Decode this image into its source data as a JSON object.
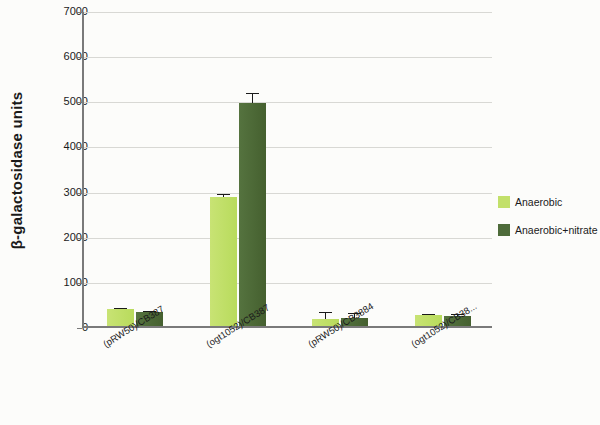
{
  "chart_data": {
    "type": "bar",
    "title": "",
    "xlabel": "",
    "ylabel": "β-galactosidase units",
    "ylim": [
      0,
      7000
    ],
    "ytick_step": 1000,
    "yticks": [
      "0",
      "1000",
      "2000",
      "3000",
      "4000",
      "5000",
      "6000",
      "7000"
    ],
    "grid": true,
    "legend_position": "right",
    "categories": [
      "(pRW50)/CB387",
      "(ogt1052)/CB387",
      "(pRW50)/CB3884",
      "(ogt1052)/CB38..."
    ],
    "series": [
      {
        "name": "Anaerobic",
        "color": "#c2e06a",
        "values": [
          370,
          2860,
          160,
          240
        ],
        "errors": [
          40,
          70,
          160,
          30
        ]
      },
      {
        "name": "Anaerobic+nitrate",
        "color": "#4e6b3a",
        "values": [
          300,
          4940,
          180,
          225
        ],
        "errors": [
          30,
          220,
          110,
          35
        ]
      }
    ]
  },
  "legend": {
    "items": [
      {
        "label": "Anaerobic",
        "color": "#c2e06a"
      },
      {
        "label": "Anaerobic+nitrate",
        "color": "#4e6b3a"
      }
    ]
  }
}
